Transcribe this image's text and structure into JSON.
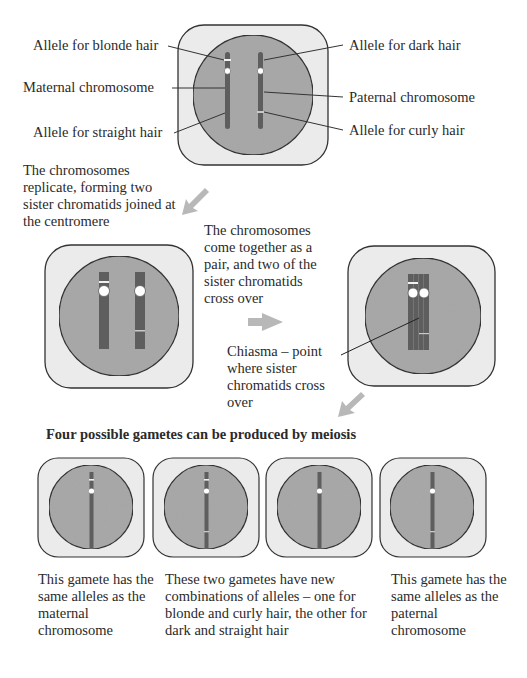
{
  "colors": {
    "cell_outer": "#ebebeb",
    "cell_inner": "#a9a9a9",
    "chromosome": "#5e5e5e",
    "outline": "#333333",
    "arrow": "#b8b8b8",
    "text": "#2a2a2a"
  },
  "stage1": {
    "labels": {
      "blonde": "Allele for blonde hair",
      "maternal": "Maternal chromosome",
      "straight": "Allele for straight hair",
      "dark": "Allele for dark hair",
      "paternal": "Paternal chromosome",
      "curly": "Allele for curly hair"
    }
  },
  "stage2": {
    "caption": "The chromosomes replicate, forming two sister chromatids joined at the centromere"
  },
  "stage3": {
    "caption": "The chromosomes come together as a pair, and two of the sister chromatids cross over",
    "chiasma_label": "Chiasma – point where sister chromatids cross over"
  },
  "gametes": {
    "title": "Four possible gametes can be produced by meiosis",
    "captions": [
      "This gamete has the same alleles as the maternal chromosome",
      "These two gametes have new combinations of alleles – one for blonde and curly hair, the other for dark and straight hair",
      "This gamete has the same alleles as the paternal chromosome"
    ]
  }
}
